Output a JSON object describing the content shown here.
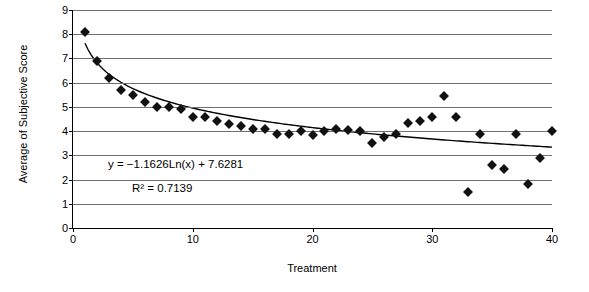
{
  "chart_data": {
    "type": "scatter",
    "title": "",
    "xlabel": "Treatment",
    "ylabel": "Average of Subjective Score",
    "xlim": [
      0,
      40
    ],
    "ylim": [
      0,
      9
    ],
    "xticks": [
      0,
      10,
      20,
      30,
      40
    ],
    "yticks": [
      0,
      1,
      2,
      3,
      4,
      5,
      6,
      7,
      8,
      9
    ],
    "grid": "horizontal",
    "legend": "none",
    "annotations": [
      "y = −1.1626Ln(x) + 7.6281",
      "R² = 0.7139"
    ],
    "trendline": {
      "kind": "logarithmic",
      "equation": "y = -1.1626*Ln(x) + 7.6281",
      "slope": -1.1626,
      "intercept": 7.6281,
      "r_squared": 0.7139
    },
    "x": [
      1,
      2,
      3,
      4,
      5,
      6,
      7,
      8,
      9,
      10,
      11,
      12,
      13,
      14,
      15,
      16,
      17,
      18,
      19,
      20,
      21,
      22,
      23,
      24,
      25,
      26,
      27,
      28,
      29,
      30,
      31,
      32,
      33,
      34,
      35,
      36,
      37,
      38,
      39,
      40
    ],
    "y": [
      8.1,
      6.9,
      6.2,
      5.7,
      5.5,
      5.2,
      5.0,
      5.0,
      4.9,
      4.6,
      4.6,
      4.4,
      4.3,
      4.2,
      4.1,
      4.1,
      3.9,
      3.9,
      4.0,
      3.85,
      4.0,
      4.1,
      4.05,
      4.0,
      3.5,
      3.75,
      3.9,
      4.35,
      4.4,
      4.6,
      5.45,
      4.6,
      1.5,
      3.9,
      2.6,
      2.45,
      3.9,
      1.8,
      2.9,
      4.0
    ],
    "marker": {
      "shape": "diamond",
      "color": "#111111",
      "size": 7
    },
    "trendline_color": "#000000",
    "gridline_color": "#6f6f6f"
  },
  "labels": {
    "y_axis_title": "Average of Subjective Score",
    "x_axis_title": "Treatment"
  }
}
